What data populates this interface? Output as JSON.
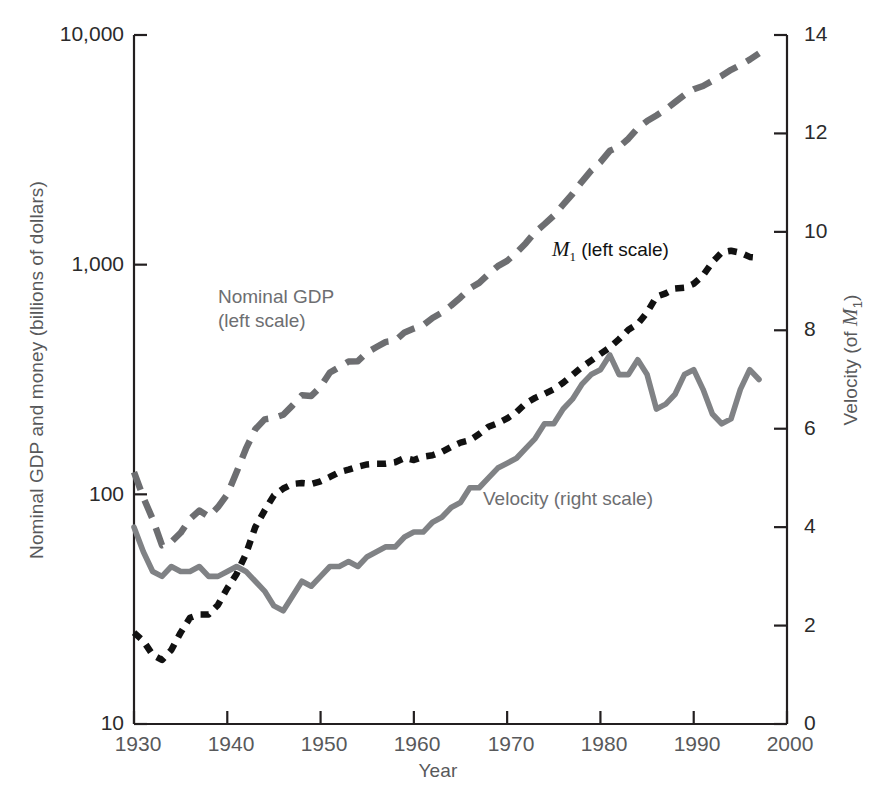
{
  "chart_data": {
    "type": "line",
    "title": "",
    "xlabel": "Year",
    "ylabel_left": "Nominal GDP and money (billions of dollars)",
    "ylabel_right": "Velocity (of M1)",
    "xlim": [
      1930,
      2000
    ],
    "xticks": [
      "1930",
      "1940",
      "1950",
      "1960",
      "1970",
      "1980",
      "1990",
      "2000"
    ],
    "xtick_values": [
      1930,
      1940,
      1950,
      1960,
      1970,
      1980,
      1990,
      2000
    ],
    "left_axis_scale": "log",
    "ylim_left": [
      10,
      10000
    ],
    "yticks_left": [
      "10",
      "100",
      "1,000",
      "10,000"
    ],
    "ytick_values_left": [
      10,
      100,
      1000,
      10000
    ],
    "right_axis_scale": "linear",
    "ylim_right": [
      0,
      14
    ],
    "yticks_right": [
      "0",
      "2",
      "4",
      "6",
      "8",
      "10",
      "12",
      "14"
    ],
    "ytick_values_right": [
      0,
      2,
      4,
      6,
      8,
      10,
      12,
      14
    ],
    "grid": false,
    "legend_position": "in-plot annotations",
    "annotations": [
      {
        "id": "gdp",
        "text": "Nominal GDP\n(left scale)",
        "color": "#6d6e71"
      },
      {
        "id": "m1",
        "text": "M1 (left scale)",
        "color": "#111111"
      },
      {
        "id": "velocity",
        "text": "Velocity (right scale)",
        "color": "#6d6e71"
      }
    ],
    "series": [
      {
        "name": "Nominal GDP (left scale)",
        "axis": "left",
        "color": "#6d6e71",
        "style": "dashed",
        "x": [
          1930,
          1931,
          1932,
          1933,
          1934,
          1935,
          1936,
          1937,
          1938,
          1939,
          1940,
          1941,
          1942,
          1943,
          1944,
          1945,
          1946,
          1947,
          1948,
          1949,
          1950,
          1951,
          1952,
          1953,
          1954,
          1955,
          1956,
          1957,
          1958,
          1959,
          1960,
          1961,
          1962,
          1963,
          1964,
          1965,
          1966,
          1967,
          1968,
          1969,
          1970,
          1971,
          1972,
          1973,
          1974,
          1975,
          1976,
          1977,
          1978,
          1979,
          1980,
          1981,
          1982,
          1983,
          1984,
          1985,
          1986,
          1987,
          1988,
          1989,
          1990,
          1991,
          1992,
          1993,
          1994,
          1995,
          1996,
          1997
        ],
        "values": [
          125,
          97,
          78,
          60,
          62,
          68,
          78,
          85,
          80,
          88,
          100,
          125,
          158,
          192,
          212,
          215,
          222,
          244,
          270,
          268,
          294,
          339,
          358,
          379,
          380,
          415,
          438,
          461,
          467,
          507,
          527,
          545,
          586,
          618,
          664,
          720,
          788,
          833,
          910,
          985,
          1039,
          1128,
          1240,
          1385,
          1501,
          1635,
          1824,
          2031,
          2295,
          2566,
          2795,
          3131,
          3259,
          3535,
          3933,
          4220,
          4463,
          4740,
          5104,
          5484,
          5803,
          5996,
          6318,
          6642,
          7054,
          7401,
          7813,
          8318
        ]
      },
      {
        "name": "M1 (left scale)",
        "axis": "left",
        "color": "#111111",
        "style": "dotted",
        "x": [
          1930,
          1931,
          1932,
          1933,
          1934,
          1935,
          1936,
          1937,
          1938,
          1939,
          1940,
          1941,
          1942,
          1943,
          1944,
          1945,
          1946,
          1947,
          1948,
          1949,
          1950,
          1951,
          1952,
          1953,
          1954,
          1955,
          1956,
          1957,
          1958,
          1959,
          1960,
          1961,
          1962,
          1963,
          1964,
          1965,
          1966,
          1967,
          1968,
          1969,
          1970,
          1971,
          1972,
          1973,
          1974,
          1975,
          1976,
          1977,
          1978,
          1979,
          1980,
          1981,
          1982,
          1983,
          1984,
          1985,
          1986,
          1987,
          1988,
          1989,
          1990,
          1991,
          1992,
          1993,
          1994,
          1995,
          1996,
          1997
        ],
        "values": [
          25,
          23,
          20,
          19,
          21,
          25,
          29,
          30,
          30,
          33,
          39,
          45,
          55,
          72,
          85,
          99,
          106,
          111,
          112,
          111,
          114,
          119,
          125,
          128,
          132,
          135,
          136,
          136,
          138,
          144,
          141,
          146,
          148,
          153,
          161,
          168,
          172,
          183,
          197,
          204,
          214,
          228,
          249,
          263,
          274,
          287,
          306,
          331,
          358,
          382,
          409,
          436,
          474,
          521,
          552,
          620,
          725,
          750,
          787,
          794,
          826,
          897,
          1025,
          1130,
          1150,
          1127,
          1081,
          1072
        ]
      },
      {
        "name": "Velocity (right scale)",
        "axis": "right",
        "color": "#808285",
        "style": "solid",
        "x": [
          1930,
          1931,
          1932,
          1933,
          1934,
          1935,
          1936,
          1937,
          1938,
          1939,
          1940,
          1941,
          1942,
          1943,
          1944,
          1945,
          1946,
          1947,
          1948,
          1949,
          1950,
          1951,
          1952,
          1953,
          1954,
          1955,
          1956,
          1957,
          1958,
          1959,
          1960,
          1961,
          1962,
          1963,
          1964,
          1965,
          1966,
          1967,
          1968,
          1969,
          1970,
          1971,
          1972,
          1973,
          1974,
          1975,
          1976,
          1977,
          1978,
          1979,
          1980,
          1981,
          1982,
          1983,
          1984,
          1985,
          1986,
          1987,
          1988,
          1989,
          1990,
          1991,
          1992,
          1993,
          1994,
          1995,
          1996,
          1997
        ],
        "values": [
          4.0,
          3.5,
          3.1,
          3.0,
          3.2,
          3.1,
          3.1,
          3.2,
          3.0,
          3.0,
          3.1,
          3.2,
          3.1,
          2.9,
          2.7,
          2.4,
          2.3,
          2.6,
          2.9,
          2.8,
          3.0,
          3.2,
          3.2,
          3.3,
          3.2,
          3.4,
          3.5,
          3.6,
          3.6,
          3.8,
          3.9,
          3.9,
          4.1,
          4.2,
          4.4,
          4.5,
          4.8,
          4.8,
          5.0,
          5.2,
          5.3,
          5.4,
          5.6,
          5.8,
          6.1,
          6.1,
          6.4,
          6.6,
          6.9,
          7.1,
          7.2,
          7.5,
          7.1,
          7.1,
          7.4,
          7.1,
          6.4,
          6.5,
          6.7,
          7.1,
          7.2,
          6.8,
          6.3,
          6.1,
          6.2,
          6.8,
          7.2,
          7.0
        ]
      }
    ]
  },
  "axes": {
    "x_label": "Year",
    "y_left_label": "Nominal GDP and money (billions of dollars)",
    "y_right_label_prefix": "Velocity (of ",
    "y_right_label_var": "M",
    "y_right_label_sub": "1",
    "y_right_label_suffix": ")",
    "ticks_x": [
      "1930",
      "1940",
      "1950",
      "1960",
      "1970",
      "1980",
      "1990",
      "2000"
    ],
    "ticks_y_left": [
      "10,000",
      "1,000",
      "100",
      "10"
    ],
    "ticks_y_right": [
      "14",
      "12",
      "10",
      "8",
      "6",
      "4",
      "2",
      "0"
    ]
  },
  "annotations": {
    "gdp_line1": "Nominal GDP",
    "gdp_line2": "(left scale)",
    "m1_var": "M",
    "m1_sub": "1",
    "m1_rest": " (left scale)",
    "velocity": "Velocity (right scale)"
  },
  "colors": {
    "gdp": "#6d6e71",
    "m1": "#111111",
    "velocity": "#808285",
    "axis": "#231f20",
    "tick_text": "#2b2b2b",
    "label_text": "#58595b"
  }
}
